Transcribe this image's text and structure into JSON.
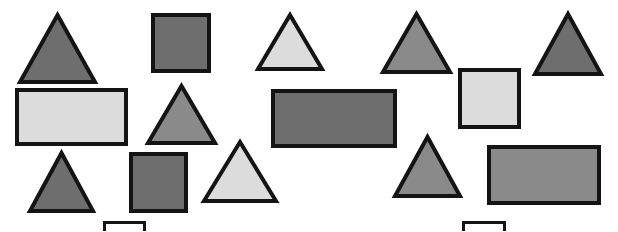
{
  "scene": {
    "title": "Geometric shapes on white background",
    "width": 618,
    "height": 231,
    "background_color": "#ffffff",
    "outline_color": "#141414",
    "palette": {
      "dark_gray": "#6e6e6e",
      "medium_gray": "#8a8a8a",
      "light_gray": "#dcdcdc",
      "white": "#ffffff",
      "outline": "#141414"
    },
    "counts": {
      "triangles": 8,
      "squares": 3,
      "rectangles": 3,
      "partial_shapes": 2,
      "total_visible": 16
    }
  },
  "shapes": [
    {
      "id": "triangle-1",
      "kind": "triangle",
      "fill": "#6e6e6e",
      "fill_name": "dark gray",
      "stroke": "#141414",
      "stroke_width": 4,
      "x": 18,
      "y": 12,
      "w": 79,
      "h": 72
    },
    {
      "id": "square-1",
      "kind": "square",
      "fill": "#6e6e6e",
      "fill_name": "dark gray",
      "stroke": "#141414",
      "stroke_width": 4,
      "x": 151,
      "y": 13,
      "w": 60,
      "h": 60
    },
    {
      "id": "triangle-2",
      "kind": "triangle",
      "fill": "#dcdcdc",
      "fill_name": "light gray",
      "stroke": "#141414",
      "stroke_width": 4,
      "x": 256,
      "y": 12,
      "w": 68,
      "h": 59
    },
    {
      "id": "triangle-3",
      "kind": "triangle",
      "fill": "#8a8a8a",
      "fill_name": "medium gray",
      "stroke": "#141414",
      "stroke_width": 4,
      "x": 381,
      "y": 11,
      "w": 71,
      "h": 63
    },
    {
      "id": "triangle-4",
      "kind": "triangle",
      "fill": "#6e6e6e",
      "fill_name": "dark gray",
      "stroke": "#141414",
      "stroke_width": 4,
      "x": 533,
      "y": 11,
      "w": 70,
      "h": 65
    },
    {
      "id": "rectangle-1",
      "kind": "rectangle",
      "fill": "#dcdcdc",
      "fill_name": "light gray",
      "stroke": "#141414",
      "stroke_width": 4,
      "x": 15,
      "y": 88,
      "w": 113,
      "h": 58
    },
    {
      "id": "triangle-5",
      "kind": "triangle",
      "fill": "#8a8a8a",
      "fill_name": "medium gray",
      "stroke": "#141414",
      "stroke_width": 4,
      "x": 146,
      "y": 83,
      "w": 71,
      "h": 62
    },
    {
      "id": "rectangle-2",
      "kind": "rectangle",
      "fill": "#6e6e6e",
      "fill_name": "dark gray",
      "stroke": "#141414",
      "stroke_width": 4,
      "x": 271,
      "y": 89,
      "w": 126,
      "h": 59
    },
    {
      "id": "square-2",
      "kind": "square",
      "fill": "#dcdcdc",
      "fill_name": "light gray",
      "stroke": "#141414",
      "stroke_width": 4,
      "x": 458,
      "y": 68,
      "w": 63,
      "h": 61
    },
    {
      "id": "triangle-6",
      "kind": "triangle",
      "fill": "#6e6e6e",
      "fill_name": "dark gray",
      "stroke": "#141414",
      "stroke_width": 4,
      "x": 28,
      "y": 150,
      "w": 67,
      "h": 63
    },
    {
      "id": "square-3",
      "kind": "square",
      "fill": "#6e6e6e",
      "fill_name": "dark gray",
      "stroke": "#141414",
      "stroke_width": 4,
      "x": 129,
      "y": 152,
      "w": 59,
      "h": 61
    },
    {
      "id": "triangle-7",
      "kind": "triangle",
      "fill": "#dcdcdc",
      "fill_name": "light gray",
      "stroke": "#141414",
      "stroke_width": 4,
      "x": 202,
      "y": 139,
      "w": 76,
      "h": 64
    },
    {
      "id": "triangle-8",
      "kind": "triangle",
      "fill": "#8a8a8a",
      "fill_name": "medium gray",
      "stroke": "#141414",
      "stroke_width": 4,
      "x": 393,
      "y": 134,
      "w": 69,
      "h": 64
    },
    {
      "id": "rectangle-3",
      "kind": "rectangle",
      "fill": "#8a8a8a",
      "fill_name": "medium gray",
      "stroke": "#141414",
      "stroke_width": 4,
      "x": 487,
      "y": 145,
      "w": 114,
      "h": 60
    },
    {
      "id": "partial-rectangle-left",
      "kind": "rectangle",
      "fill": "#ffffff",
      "fill_name": "white",
      "stroke": "#141414",
      "stroke_width": 3,
      "x": 103,
      "y": 221,
      "w": 43,
      "h": 26
    },
    {
      "id": "partial-rectangle-right",
      "kind": "rectangle",
      "fill": "#ffffff",
      "fill_name": "white",
      "stroke": "#141414",
      "stroke_width": 3,
      "x": 462,
      "y": 221,
      "w": 44,
      "h": 26
    }
  ]
}
